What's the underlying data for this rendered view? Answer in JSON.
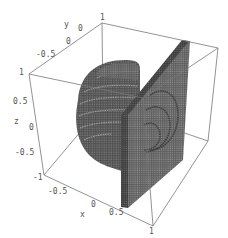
{
  "chart_data": {
    "type": "voxel3d",
    "title": "",
    "axes": {
      "x": {
        "label": "x",
        "range": [
          -1,
          1
        ],
        "ticks": [
          "-0.5",
          "0",
          "0.5",
          "1"
        ]
      },
      "y": {
        "label": "y",
        "range": [
          -1,
          1
        ],
        "ticks": [
          "-0.5",
          "0",
          "0.5",
          "1"
        ]
      },
      "z": {
        "label": "z",
        "range": [
          -1,
          1
        ],
        "ticks": [
          "1",
          "0.5",
          "0",
          "-0.5",
          "-1"
        ]
      }
    },
    "objects": [
      {
        "name": "sphere",
        "center": [
          0,
          0,
          0
        ],
        "radius": 0.8,
        "style": "voxel",
        "color": "#555555"
      },
      {
        "name": "slab",
        "x": 0.6,
        "y_range": [
          -1,
          1
        ],
        "z_range": [
          -1,
          1
        ],
        "style": "voxel",
        "color": "#6a6a6a"
      }
    ],
    "box": true,
    "grid": false,
    "legend": "none"
  },
  "colors": {
    "edge": "#777777",
    "voxel_dark": "#3e3e3e",
    "voxel_light": "#9a9a9a",
    "background": "#ffffff"
  }
}
